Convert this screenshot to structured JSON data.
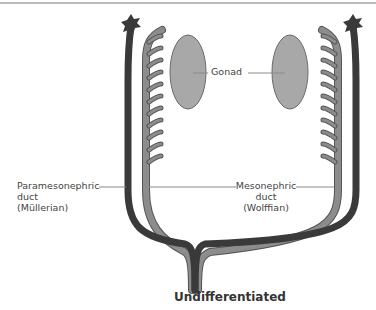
{
  "figure": {
    "caption": "Undifferentiated",
    "colors": {
      "paramesonephric_duct": "#3a3a3a",
      "mesonephric_duct": "#8c8c8c",
      "gonad": "#a8a8a8",
      "leader_line": "#8a8a8a",
      "text": "#444444"
    }
  },
  "labels": {
    "gonad": "Gonad",
    "paramesonephric": {
      "line1": "Paramesonephric",
      "line2": "duct",
      "line3": "(Müllerian)"
    },
    "mesonephric": {
      "line1": "Mesonephric",
      "line2": "duct",
      "line3": "(Wolffian)"
    }
  }
}
